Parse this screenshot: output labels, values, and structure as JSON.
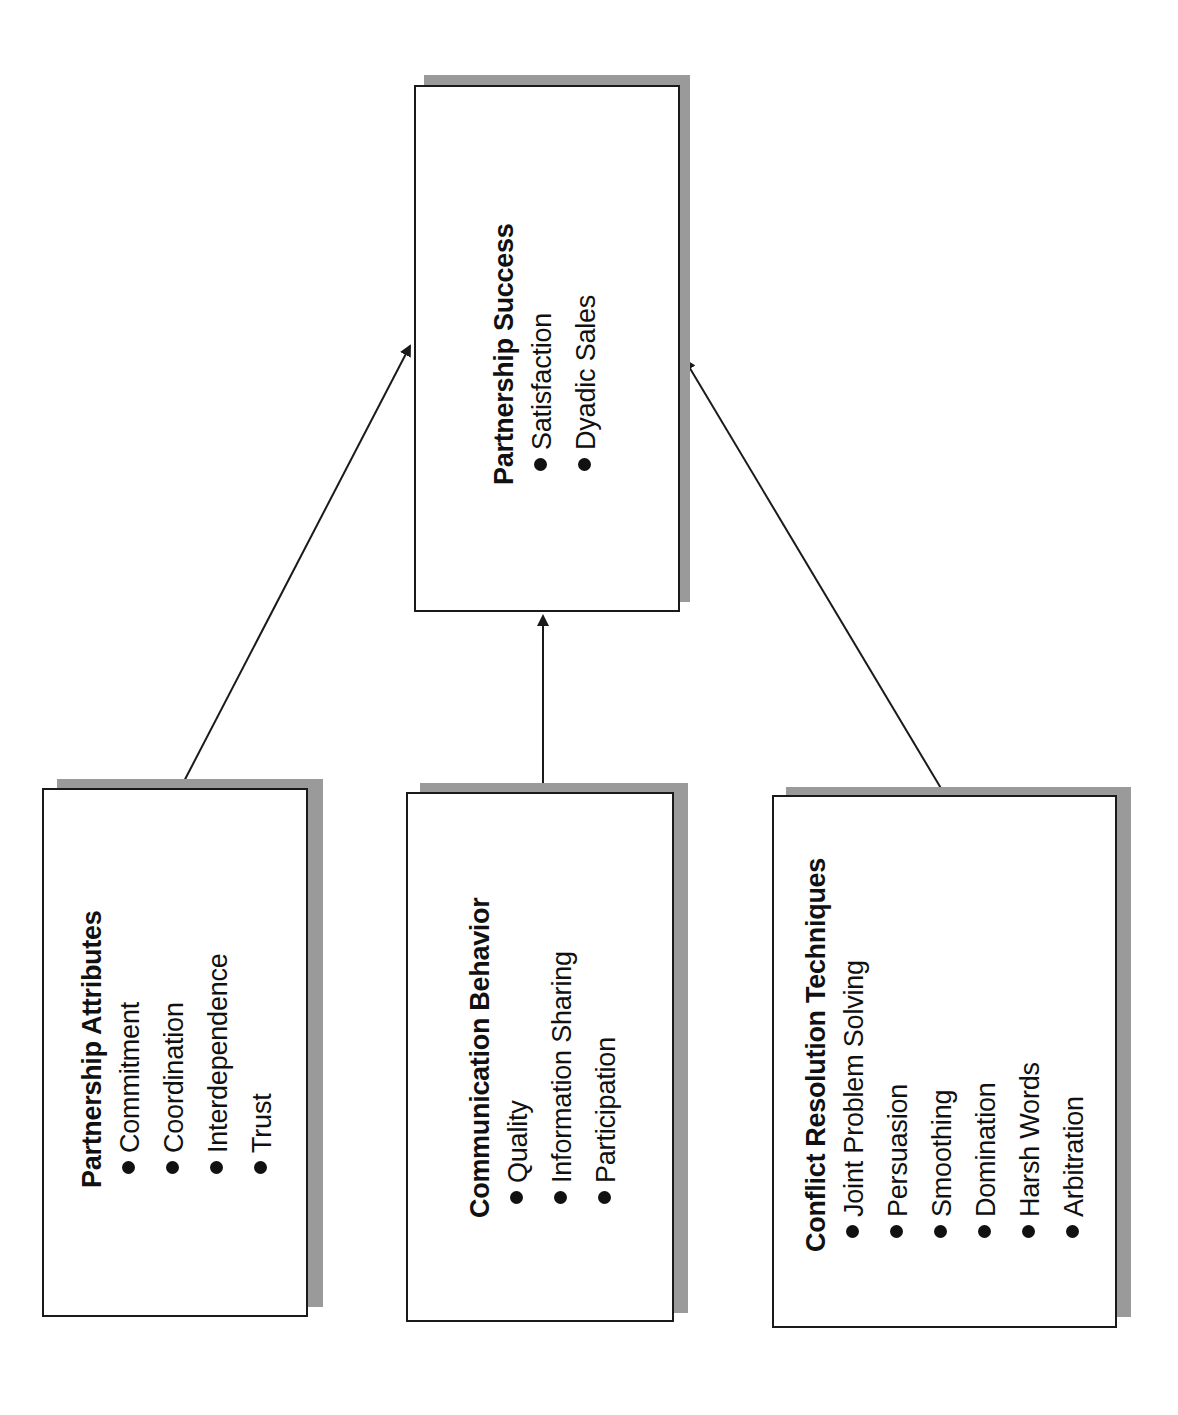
{
  "diagram": {
    "type": "flow-diagram",
    "orientation": "rotated-90-ccw",
    "nodes": [
      {
        "id": "success",
        "title": "Partnership Success",
        "items": [
          "Satisfaction",
          "Dyadic Sales"
        ]
      },
      {
        "id": "attributes",
        "title": "Partnership Attributes",
        "items": [
          "Commitment",
          "Coordination",
          "Interdependence",
          "Trust"
        ]
      },
      {
        "id": "communication",
        "title": "Communication Behavior",
        "items": [
          "Quality",
          "Information Sharing",
          "Participation"
        ]
      },
      {
        "id": "conflict",
        "title": "Conflict Resolution Techniques",
        "items": [
          "Joint Problem Solving",
          "Persuasion",
          "Smoothing",
          "Domination",
          "Harsh Words",
          "Arbitration"
        ]
      }
    ],
    "edges": [
      {
        "from": "attributes",
        "to": "success"
      },
      {
        "from": "communication",
        "to": "success"
      },
      {
        "from": "conflict",
        "to": "success"
      }
    ],
    "colors": {
      "border": "#1a1a1a",
      "shadow": "#9a9a9a",
      "background": "#ffffff",
      "arrow": "#1a1a1a"
    }
  }
}
